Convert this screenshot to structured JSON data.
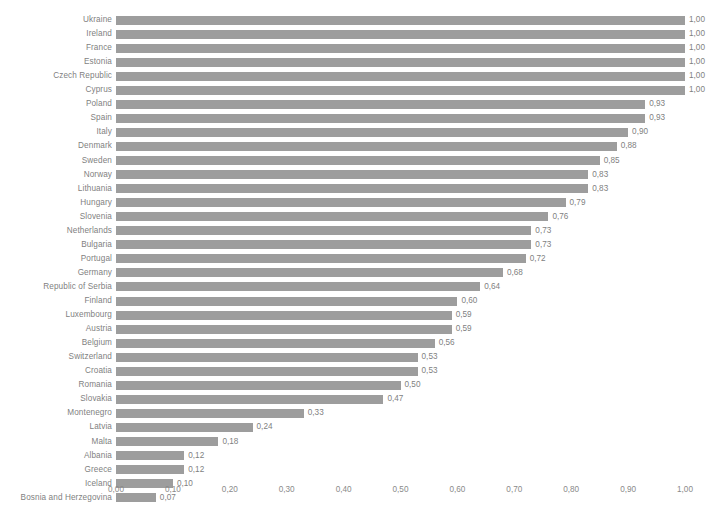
{
  "chart_data": {
    "type": "bar",
    "orientation": "horizontal",
    "title": "",
    "subtitle": "",
    "xlabel": "",
    "ylabel": "",
    "xlim": [
      0,
      1
    ],
    "grid": false,
    "legend": null,
    "decimal_separator": ",",
    "value_format": "0,00",
    "bar_color": "#9d9d9d",
    "text_color": "#7f7f7f",
    "background": "#ffffff",
    "xticks": [
      0,
      0.1,
      0.2,
      0.3,
      0.4,
      0.5,
      0.6,
      0.7,
      0.8,
      0.9,
      1.0
    ],
    "xtick_labels": [
      "0,00",
      "0,10",
      "0,20",
      "0,30",
      "0,40",
      "0,50",
      "0,60",
      "0,70",
      "0,80",
      "0,90",
      "1,00"
    ],
    "categories": [
      "Ukraine",
      "Ireland",
      "France",
      "Estonia",
      "Czech Republic",
      "Cyprus",
      "Poland",
      "Spain",
      "Italy",
      "Denmark",
      "Sweden",
      "Norway",
      "Lithuania",
      "Hungary",
      "Slovenia",
      "Netherlands",
      "Bulgaria",
      "Portugal",
      "Germany",
      "Republic of Serbia",
      "Finland",
      "Luxembourg",
      "Austria",
      "Belgium",
      "Switzerland",
      "Croatia",
      "Romania",
      "Slovakia",
      "Montenegro",
      "Latvia",
      "Malta",
      "Albania",
      "Greece",
      "Iceland",
      "Bosnia and Herzegovina"
    ],
    "values": [
      1.0,
      1.0,
      1.0,
      1.0,
      1.0,
      1.0,
      0.93,
      0.93,
      0.9,
      0.88,
      0.85,
      0.83,
      0.83,
      0.79,
      0.76,
      0.73,
      0.73,
      0.72,
      0.68,
      0.64,
      0.6,
      0.59,
      0.59,
      0.56,
      0.53,
      0.53,
      0.5,
      0.47,
      0.33,
      0.24,
      0.18,
      0.12,
      0.12,
      0.1,
      0.07
    ],
    "value_labels": [
      "1,00",
      "1,00",
      "1,00",
      "1,00",
      "1,00",
      "1,00",
      "0,93",
      "0,93",
      "0,90",
      "0,88",
      "0,85",
      "0,83",
      "0,83",
      "0,79",
      "0,76",
      "0,73",
      "0,73",
      "0,72",
      "0,68",
      "0,64",
      "0,60",
      "0,59",
      "0,59",
      "0,56",
      "0,53",
      "0,53",
      "0,50",
      "0,47",
      "0,33",
      "0,24",
      "0,18",
      "0,12",
      "0,12",
      "0,10",
      "0,07"
    ]
  }
}
